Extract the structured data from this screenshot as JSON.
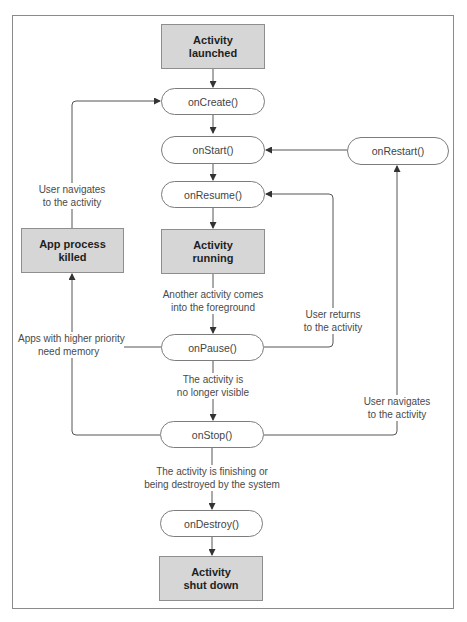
{
  "diagram": {
    "states": {
      "launched": {
        "line1": "Activity",
        "line2": "launched"
      },
      "running": {
        "line1": "Activity",
        "line2": "running"
      },
      "killed": {
        "line1": "App process",
        "line2": "killed"
      },
      "shutdown": {
        "line1": "Activity",
        "line2": "shut down"
      }
    },
    "callbacks": {
      "onCreate": "onCreate()",
      "onStart": "onStart()",
      "onRestart": "onRestart()",
      "onResume": "onResume()",
      "onPause": "onPause()",
      "onStop": "onStop()",
      "onDestroy": "onDestroy()"
    },
    "edge_labels": {
      "user_navigates_left": {
        "line1": "User navigates",
        "line2": "to the activity"
      },
      "another_activity": {
        "line1": "Another activity comes",
        "line2": "into the foreground"
      },
      "user_returns": {
        "line1": "User returns",
        "line2": "to the activity"
      },
      "higher_priority": {
        "line1": "Apps with higher priority",
        "line2": "need memory"
      },
      "no_longer_visible": {
        "line1": "The activity is",
        "line2": "no longer visible"
      },
      "user_navigates_right": {
        "line1": "User navigates",
        "line2": "to the activity"
      },
      "finishing": {
        "line1": "The activity is finishing or",
        "line2": "being destroyed by the system"
      }
    },
    "colors": {
      "state_fill": "#d6d6d6",
      "line": "#555555",
      "frame": "#8a8a8a"
    }
  }
}
